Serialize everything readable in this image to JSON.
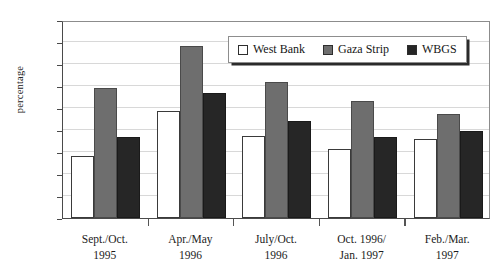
{
  "chart_data": {
    "type": "bar",
    "title": "",
    "xlabel": "",
    "ylabel": "percentage",
    "ylim": [
      0,
      45
    ],
    "ytick_step": 5,
    "yticks": [
      0,
      5,
      10,
      15,
      20,
      25,
      30,
      35,
      40,
      45
    ],
    "ytick_labels": [
      "0",
      "5",
      "10",
      "15",
      "20",
      "25",
      "30",
      "35",
      "40",
      "45"
    ],
    "grid": true,
    "grid_axis": "y",
    "legend_position": "upper center",
    "categories": [
      "Sept./Oct. 1995",
      "Apr./May 1996",
      "July/Oct. 1996",
      "Oct. 1996/ Jan. 1997",
      "Feb./Mar. 1997"
    ],
    "category_lines": [
      [
        "Sept./Oct.",
        "1995"
      ],
      [
        "Apr./May",
        "1996"
      ],
      [
        "July/Oct.",
        "1996"
      ],
      [
        "Oct. 1996/",
        "Jan. 1997"
      ],
      [
        "Feb./Mar.",
        "1997"
      ]
    ],
    "series": [
      {
        "name": "West Bank",
        "key": "west-bank",
        "color": "#ffffff",
        "values": [
          14.0,
          24.4,
          18.7,
          15.7,
          18.0
        ]
      },
      {
        "name": "Gaza Strip",
        "key": "gaza-strip",
        "color": "#6e6e6e",
        "values": [
          29.5,
          39.2,
          31.0,
          26.5,
          23.7
        ]
      },
      {
        "name": "WBGS",
        "key": "wbgs",
        "color": "#262626",
        "values": [
          18.3,
          28.5,
          22.0,
          18.5,
          19.8
        ]
      }
    ]
  }
}
